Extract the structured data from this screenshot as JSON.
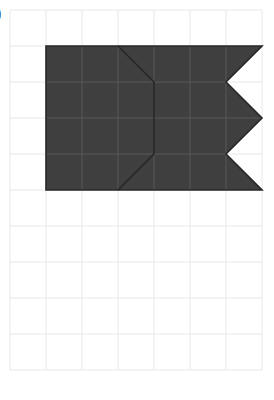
{
  "figure": {
    "label": ")",
    "background_color": "#ffffff",
    "grid": {
      "origin_x": 10,
      "origin_y": 10,
      "cell_size": 36,
      "cols": 7,
      "rows": 10,
      "line_color": "#e8e8e8",
      "line_width": 1,
      "right_edge_x": 262,
      "bottom_edge_y": 370
    },
    "shape": {
      "name": "notched-banner-with-chevron",
      "fill_color": "#3f3f3f",
      "stroke_color": "#262626",
      "stroke_width": 1.6,
      "inner_grid_line_color": "#585858",
      "outline_points": "46,46 262,46 226,82 262,118 226,154 262,190 46,190",
      "inner_chevron_points": "118,46 154,82 154,154 118,190",
      "vertices": [
        {
          "x": 46,
          "y": 46
        },
        {
          "x": 262,
          "y": 46
        },
        {
          "x": 226,
          "y": 82
        },
        {
          "x": 262,
          "y": 118
        },
        {
          "x": 226,
          "y": 154
        },
        {
          "x": 262,
          "y": 190
        },
        {
          "x": 46,
          "y": 190
        }
      ],
      "chevron_vertices": [
        {
          "x": 118,
          "y": 46
        },
        {
          "x": 154,
          "y": 82
        },
        {
          "x": 154,
          "y": 154
        },
        {
          "x": 118,
          "y": 190
        }
      ]
    }
  },
  "chart_data": {
    "type": "table",
    "title": "",
    "xlabel": "",
    "ylabel": "",
    "grid_units": {
      "cols": 7,
      "rows": 10,
      "cell_px": 36
    },
    "shape_cells_covered": 24,
    "categories": [
      "grid-columns",
      "grid-rows"
    ],
    "values": [
      7,
      10
    ]
  }
}
